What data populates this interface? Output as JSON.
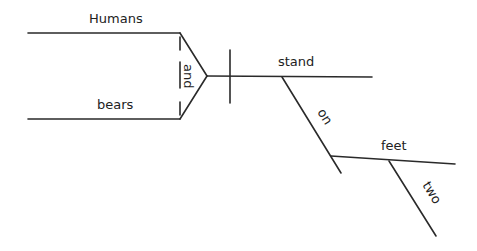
{
  "diagram": {
    "type": "sentence-diagram",
    "sentence": "Humans and bears stand on two feet",
    "subjects": [
      {
        "word": "Humans"
      },
      {
        "word": "bears"
      }
    ],
    "conjunction": "and",
    "verb": "stand",
    "preposition": "on",
    "object": "feet",
    "modifier": "two",
    "colors": {
      "line": "#2a2a2a",
      "text": "#222222",
      "background": "#ffffff"
    }
  }
}
